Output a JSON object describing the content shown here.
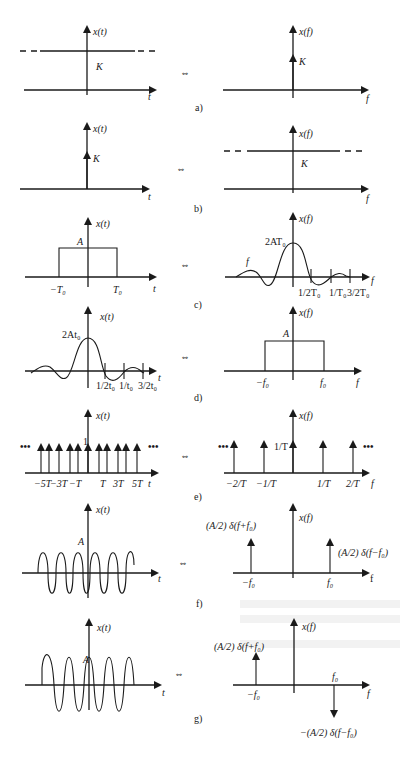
{
  "figure": {
    "pairs": [
      {
        "id": "a",
        "caption": "a)",
        "time": {
          "ylabel": "x(t)",
          "xlabel": "t",
          "label": "K",
          "desc": "constant K"
        },
        "freq": {
          "ylabel": "x(f)",
          "xlabel": "f",
          "label": "K",
          "desc": "impulse K at f=0"
        }
      },
      {
        "id": "b",
        "caption": "b)",
        "time": {
          "ylabel": "x(t)",
          "xlabel": "t",
          "label": "K",
          "desc": "impulse K at t=0"
        },
        "freq": {
          "ylabel": "x(f)",
          "xlabel": "f",
          "label": "K",
          "desc": "constant K"
        }
      },
      {
        "id": "c",
        "caption": "c)",
        "time": {
          "ylabel": "x(t)",
          "xlabel": "t",
          "amp": "A",
          "ticks": [
            "−T₀",
            "T₀"
          ]
        },
        "freq": {
          "ylabel": "x(f)",
          "xlabel": "f",
          "peak": "2AT₀",
          "curve_label": "f",
          "ticks": [
            "1/2T₀",
            "1/T₀",
            "3/2T₀"
          ]
        }
      },
      {
        "id": "d",
        "caption": "d)",
        "time": {
          "ylabel": "x(t)",
          "xlabel": "t",
          "peak": "2At₀",
          "ticks": [
            "1/2t₀",
            "1/t₀",
            "3/2t₀"
          ]
        },
        "freq": {
          "ylabel": "x(f)",
          "xlabel": "f",
          "amp": "A",
          "ticks": [
            "−f₀",
            "f₀"
          ]
        }
      },
      {
        "id": "e",
        "caption": "e)",
        "time": {
          "ylabel": "x(t)",
          "xlabel": "t",
          "amp": "1",
          "ellipsis": "•••",
          "ticks": [
            "−5T",
            "−3T",
            "−T",
            "T",
            "3T",
            "5T"
          ]
        },
        "freq": {
          "ylabel": "x(f)",
          "xlabel": "f",
          "amp": "1/T",
          "ellipsis": "•••",
          "ticks": [
            "−2/T",
            "−1/T",
            "1/T",
            "2/T"
          ]
        }
      },
      {
        "id": "f",
        "caption": "f)",
        "time": {
          "ylabel": "x(t)",
          "xlabel": "t",
          "amp": "A"
        },
        "freq": {
          "ylabel": "x(f)",
          "xlabel": "f",
          "left_label": "(A/2) δ(f+f₀)",
          "right_label": "(A/2) δ(f−f₀)",
          "ticks": [
            "−f₀",
            "f₀"
          ]
        }
      },
      {
        "id": "g",
        "caption": "g)",
        "time": {
          "ylabel": "x(t)",
          "xlabel": "t",
          "amp": "A"
        },
        "freq": {
          "ylabel": "x(f)",
          "xlabel": "f",
          "left_label": "(A/2) δ(f+f₀)",
          "right_label": "−(A/2) δ(f−f₀)",
          "ticks": [
            "−f₀",
            "f₀"
          ]
        }
      }
    ],
    "equivalence_symbol": "⇔"
  }
}
